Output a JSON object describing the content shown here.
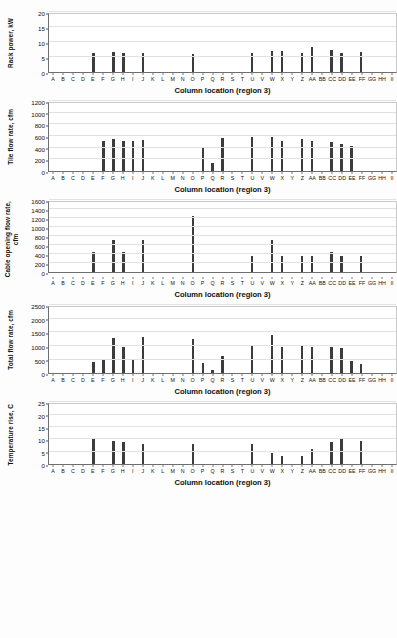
{
  "xlabel_common": "Column location (region 3)",
  "categories": [
    "A",
    "B",
    "C",
    "D",
    "E",
    "F",
    "G",
    "H",
    "I",
    "J",
    "K",
    "L",
    "M",
    "N",
    "O",
    "P",
    "Q",
    "R",
    "S",
    "T",
    "U",
    "V",
    "W",
    "X",
    "Y",
    "Z",
    "AA",
    "BB",
    "CC",
    "DD",
    "EE",
    "FF",
    "GG",
    "HH",
    "II"
  ],
  "colors": {
    "bar": "#3c3c3c",
    "axis": "#6e6e6e",
    "grid": "#e2e2e2",
    "text": "#111111"
  },
  "chart_data": [
    {
      "id": "rack-power",
      "type": "bar",
      "title": "",
      "xlabel": "Column location (region 3)",
      "ylabel": "Rack power, kW",
      "ylim": [
        0,
        20
      ],
      "yticks": [
        0,
        5,
        10,
        15,
        20
      ],
      "grid": true,
      "categories": [
        "A",
        "B",
        "C",
        "D",
        "E",
        "F",
        "G",
        "H",
        "I",
        "J",
        "K",
        "L",
        "M",
        "N",
        "O",
        "P",
        "Q",
        "R",
        "S",
        "T",
        "U",
        "V",
        "W",
        "X",
        "Y",
        "Z",
        "AA",
        "BB",
        "CC",
        "DD",
        "EE",
        "FF",
        "GG",
        "HH",
        "II"
      ],
      "values": [
        0,
        0,
        0,
        0,
        6.5,
        0,
        6.6,
        6.2,
        0,
        6.2,
        0,
        0,
        0,
        0,
        5.9,
        0,
        0,
        0,
        0,
        0,
        6.5,
        0,
        6.9,
        7.0,
        0,
        6.2,
        8.2,
        0,
        7.2,
        6.2,
        0,
        6.7,
        0,
        0,
        0
      ]
    },
    {
      "id": "tile-flow-rate",
      "type": "bar",
      "title": "",
      "xlabel": "Column location (region 3)",
      "ylabel": "Tile flow rate, cfm",
      "ylim": [
        0,
        1200
      ],
      "yticks": [
        0,
        200,
        400,
        600,
        800,
        1000,
        1200
      ],
      "grid": true,
      "categories": [
        "A",
        "B",
        "C",
        "D",
        "E",
        "F",
        "G",
        "H",
        "I",
        "J",
        "K",
        "L",
        "M",
        "N",
        "O",
        "P",
        "Q",
        "R",
        "S",
        "T",
        "U",
        "V",
        "W",
        "X",
        "Y",
        "Z",
        "AA",
        "BB",
        "CC",
        "DD",
        "EE",
        "FF",
        "GG",
        "HH",
        "II"
      ],
      "values": [
        0,
        0,
        0,
        0,
        0,
        520,
        550,
        520,
        510,
        530,
        0,
        0,
        0,
        0,
        0,
        390,
        130,
        570,
        0,
        0,
        580,
        0,
        590,
        510,
        0,
        550,
        520,
        0,
        490,
        470,
        430,
        0,
        0,
        0,
        0
      ]
    },
    {
      "id": "cable-opening-flow-rate",
      "type": "bar",
      "title": "",
      "xlabel": "Column location (region 3)",
      "ylabel": "Cable opening flow rate,\ncfm",
      "ylim": [
        0,
        1600
      ],
      "yticks": [
        0,
        200,
        400,
        600,
        800,
        1000,
        1200,
        1400,
        1600
      ],
      "grid": true,
      "categories": [
        "A",
        "B",
        "C",
        "D",
        "E",
        "F",
        "G",
        "H",
        "I",
        "J",
        "K",
        "L",
        "M",
        "N",
        "O",
        "P",
        "Q",
        "R",
        "S",
        "T",
        "U",
        "V",
        "W",
        "X",
        "Y",
        "Z",
        "AA",
        "BB",
        "CC",
        "DD",
        "EE",
        "FF",
        "GG",
        "HH",
        "II"
      ],
      "values": [
        0,
        0,
        0,
        0,
        450,
        0,
        710,
        450,
        0,
        710,
        0,
        0,
        0,
        0,
        1250,
        0,
        0,
        0,
        0,
        0,
        360,
        0,
        710,
        360,
        0,
        360,
        360,
        0,
        450,
        360,
        0,
        360,
        0,
        0,
        0
      ]
    },
    {
      "id": "total-flow-rate",
      "type": "bar",
      "title": "",
      "xlabel": "Column location (region 3)",
      "ylabel": "Total flow rate, cfm",
      "ylim": [
        0,
        2500
      ],
      "yticks": [
        0,
        500,
        1000,
        1500,
        2000,
        2500
      ],
      "grid": true,
      "categories": [
        "A",
        "B",
        "C",
        "D",
        "E",
        "F",
        "G",
        "H",
        "I",
        "J",
        "K",
        "L",
        "M",
        "N",
        "O",
        "P",
        "Q",
        "R",
        "S",
        "T",
        "U",
        "V",
        "W",
        "X",
        "Y",
        "Z",
        "AA",
        "BB",
        "CC",
        "DD",
        "EE",
        "FF",
        "GG",
        "HH",
        "II"
      ],
      "values": [
        0,
        0,
        0,
        0,
        430,
        520,
        1280,
        960,
        490,
        1350,
        0,
        0,
        0,
        0,
        1270,
        390,
        130,
        650,
        0,
        0,
        1040,
        0,
        1420,
        960,
        0,
        1010,
        980,
        0,
        950,
        920,
        440,
        350,
        0,
        0,
        0
      ]
    },
    {
      "id": "temperature-rise",
      "type": "bar",
      "title": "",
      "xlabel": "Column location (region 3)",
      "ylabel": "Temperature rise, C",
      "ylim": [
        0,
        25
      ],
      "yticks": [
        0,
        5,
        10,
        15,
        20,
        25
      ],
      "grid": true,
      "categories": [
        "A",
        "B",
        "C",
        "D",
        "E",
        "F",
        "G",
        "H",
        "I",
        "J",
        "K",
        "L",
        "M",
        "N",
        "O",
        "P",
        "Q",
        "R",
        "S",
        "T",
        "U",
        "V",
        "W",
        "X",
        "Y",
        "Z",
        "AA",
        "BB",
        "CC",
        "DD",
        "EE",
        "FF",
        "GG",
        "HH",
        "II"
      ],
      "values": [
        0,
        0,
        0,
        0,
        10.2,
        0,
        9.2,
        8.9,
        0,
        8.3,
        0,
        0,
        0,
        0,
        8.0,
        0,
        0,
        0,
        0,
        0,
        8.0,
        0,
        4.5,
        3.5,
        0,
        3.2,
        6.2,
        0,
        9.0,
        10.1,
        0,
        9.4,
        0,
        0,
        0
      ]
    }
  ]
}
